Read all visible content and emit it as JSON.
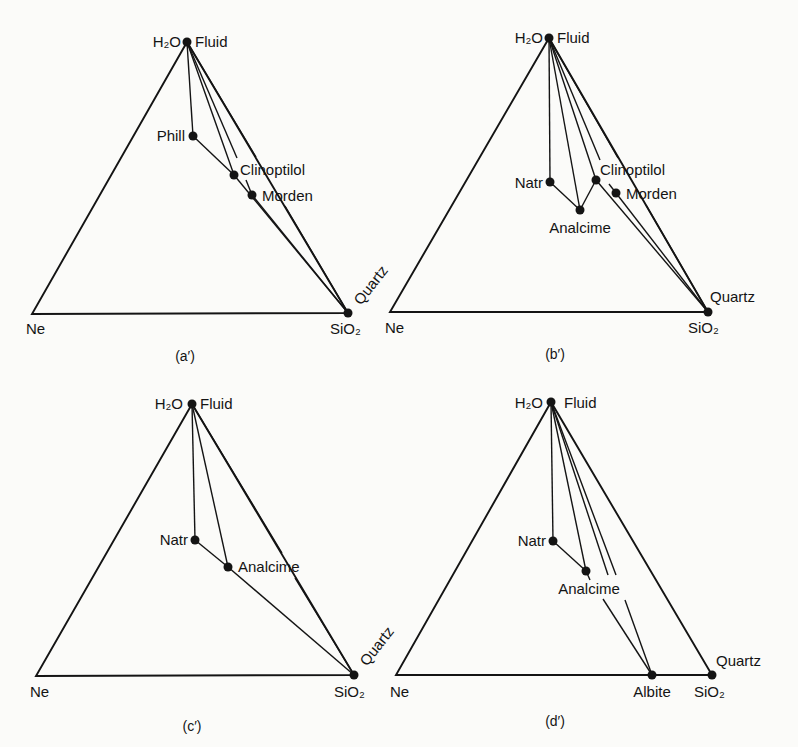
{
  "figure": {
    "panels": [
      {
        "id": "a",
        "caption": "(a′)",
        "vertices": {
          "top": {
            "label_left": "H₂O",
            "label_right": "Fluid"
          },
          "left": {
            "label": "Ne"
          },
          "right": {
            "label": "SiO₂",
            "phase": "Quartz"
          }
        },
        "phases": [
          {
            "name": "Phill"
          },
          {
            "name": "Clinoptilol"
          },
          {
            "name": "Morden"
          }
        ]
      },
      {
        "id": "b",
        "caption": "(b′)",
        "vertices": {
          "top": {
            "label_left": "H₂O",
            "label_right": "Fluid"
          },
          "left": {
            "label": "Ne"
          },
          "right": {
            "label": "SiO₂",
            "phase": "Quartz"
          }
        },
        "phases": [
          {
            "name": "Natr"
          },
          {
            "name": "Analcime"
          },
          {
            "name": "Clinoptilol"
          },
          {
            "name": "Morden"
          }
        ]
      },
      {
        "id": "c",
        "caption": "(c′)",
        "vertices": {
          "top": {
            "label_left": "H₂O",
            "label_right": "Fluid"
          },
          "left": {
            "label": "Ne"
          },
          "right": {
            "label": "SiO₂",
            "phase": "Quartz"
          }
        },
        "phases": [
          {
            "name": "Natr"
          },
          {
            "name": "Analcime"
          }
        ]
      },
      {
        "id": "d",
        "caption": "(d′)",
        "vertices": {
          "top": {
            "label_left": "H₂O",
            "label_right": "Fluid"
          },
          "left": {
            "label": "Ne"
          },
          "right": {
            "label": "SiO₂",
            "phase": "Quartz"
          }
        },
        "phases": [
          {
            "name": "Natr"
          },
          {
            "name": "Analcime"
          },
          {
            "name": "Albite"
          }
        ]
      }
    ]
  }
}
